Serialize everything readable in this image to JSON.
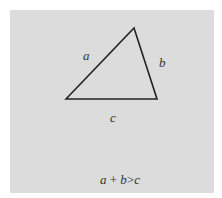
{
  "diagram": {
    "type": "triangle",
    "vertices": {
      "left": [
        66,
        99
      ],
      "top": [
        134,
        28
      ],
      "right": [
        157,
        99
      ]
    },
    "sides": [
      {
        "name": "a",
        "label": "a",
        "between": [
          "left",
          "top"
        ]
      },
      {
        "name": "b",
        "label": "b",
        "between": [
          "top",
          "right"
        ]
      },
      {
        "name": "c",
        "label": "c",
        "between": [
          "left",
          "right"
        ]
      }
    ],
    "caption": {
      "a": "a",
      "plus": "+",
      "b": "b",
      "gt": ">",
      "c": "c",
      "full": "a + b > c"
    },
    "colors": {
      "background": "#dcdcdc",
      "stroke": "#222222",
      "text": "#333333"
    }
  }
}
